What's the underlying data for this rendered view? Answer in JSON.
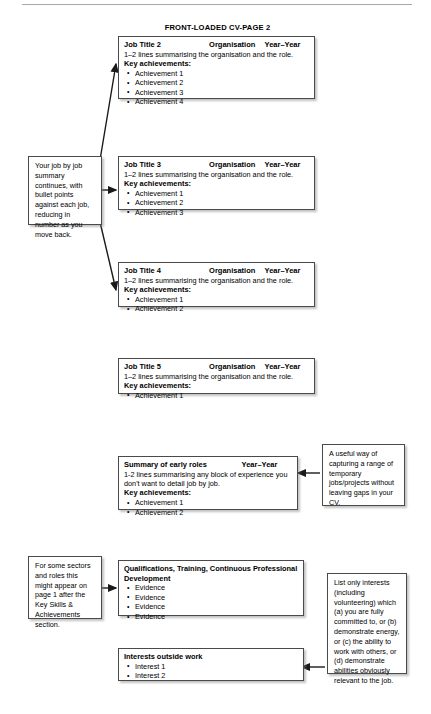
{
  "page": {
    "title": "FRONT-LOADED CV-PAGE 2",
    "divider": "horizontal-rule"
  },
  "labels": {
    "key_achievements": "Key achievements:",
    "organisation": "Organisation",
    "year_range": "Year–Year",
    "summary_line": "1–2 lines summarising the organisation and the role."
  },
  "entries": [
    {
      "id": "job-2",
      "title": "Job Title 2",
      "organisation": "Organisation",
      "years": "Year–Year",
      "summary": "1–2 lines summarising the organisation and the role.",
      "achievements_label": "Key achievements:",
      "achievements": [
        "Achievement 1",
        "Achievement 2",
        "Achievement 3",
        "Achievement 4"
      ]
    },
    {
      "id": "job-3",
      "title": "Job Title 3",
      "organisation": "Organisation",
      "years": "Year–Year",
      "summary": "1–2 lines summarising the organisation and the role.",
      "achievements_label": "Key achievements:",
      "achievements": [
        "Achievement 1",
        "Achievement 2",
        "Achievement 3"
      ]
    },
    {
      "id": "job-4",
      "title": "Job Title 4",
      "organisation": "Organisation",
      "years": "Year–Year",
      "summary": "1–2 lines summarising the organisation and the role.",
      "achievements_label": "Key achievements:",
      "achievements": [
        "Achievement 1",
        "Achievement 2"
      ]
    },
    {
      "id": "job-5",
      "title": "Job Title 5",
      "organisation": "Organisation",
      "years": "Year–Year",
      "summary": "1–2 lines summarising the organisation and the role.",
      "achievements_label": "Key achievements:",
      "achievements": [
        "Achievement 1"
      ]
    }
  ],
  "early_roles": {
    "title": "Summary of early roles",
    "years": "Year–Year",
    "summary": "1-2 lines summarising any block of experience you don't want to detail job by job.",
    "achievements_label": "Key achievements:",
    "achievements": [
      "Achievement 1",
      "Achievement 2"
    ]
  },
  "qualifications": {
    "title": "Qualifications, Training, Continuous Professional Development",
    "items": [
      "Evidence",
      "Evidence",
      "Evidence",
      "Evidence"
    ]
  },
  "interests": {
    "title": "Interests outside work",
    "items": [
      "Interest 1",
      "Interest 2"
    ]
  },
  "notes": {
    "job_summary": "Your job by job summary continues, with bullet points against each job, reducing in number as you move back.",
    "early_roles": "A useful way of capturing a range of temporary jobs/projects without leaving gaps in your CV.",
    "qualifications_placement": "For some sectors and roles this might appear on page 1 after the Key Skills & Achievements section.",
    "interests_advice": "List only interests (including volunteering) which (a) you are fully committed to, or (b) demonstrate energy, or (c) the ability to work with others, or (d) demonstrate abilities obviously relevant to the job."
  },
  "colors": {
    "box_border": "#4a4a4a",
    "rule": "#a8a8a8",
    "arrow": "#1a1a1a",
    "background": "#ffffff",
    "text": "#000000"
  }
}
